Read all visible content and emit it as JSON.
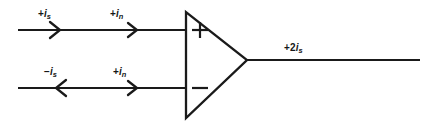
{
  "diagram": {
    "type": "circuit-schematic",
    "background_color": "#ffffff",
    "line_color": "#1a1a1a",
    "width": 430,
    "height": 126
  },
  "component": {
    "name": "operational-amplifier",
    "shape": "triangle",
    "noninverting_terminal_symbol": "+",
    "inverting_terminal_symbol": "−",
    "left_edge_x": 186,
    "top_y": 12,
    "bottom_y": 118,
    "apex_x": 247,
    "apex_y": 60
  },
  "labels": {
    "source_current_top": {
      "sign": "+",
      "symbol": "i",
      "subscript": "s",
      "full_text": "+i_s",
      "x": 40,
      "y": 10
    },
    "noise_current_top": {
      "sign": "+",
      "symbol": "i",
      "subscript": "n",
      "full_text": "+i_n",
      "x": 112,
      "y": 10
    },
    "source_current_bottom": {
      "sign": "−",
      "symbol": "i",
      "subscript": "s",
      "full_text": "-i_s",
      "x": 45,
      "y": 68
    },
    "noise_current_bottom": {
      "sign": "+",
      "symbol": "i",
      "subscript": "n",
      "full_text": "+i_n",
      "x": 115,
      "y": 68
    },
    "output_current": {
      "sign": "+",
      "coefficient": "2",
      "symbol": "i",
      "subscript": "s",
      "full_text": "+2i_s",
      "x": 285,
      "y": 44
    }
  },
  "wires": {
    "top_input": {
      "y": 30,
      "x_start": 18,
      "x_end": 186,
      "direction": "right"
    },
    "bottom_input": {
      "y": 88,
      "x_start": 18,
      "x_end": 186,
      "direction": "right"
    },
    "output": {
      "y": 60,
      "x_start": 247,
      "x_end": 420,
      "direction": "right"
    }
  },
  "arrows": {
    "top_source": {
      "x": 58,
      "y": 30,
      "direction": "right"
    },
    "top_noise": {
      "x": 135,
      "y": 30,
      "direction": "right"
    },
    "bottom_source": {
      "x": 58,
      "y": 88,
      "direction": "left"
    },
    "bottom_noise": {
      "x": 135,
      "y": 88,
      "direction": "right"
    }
  }
}
